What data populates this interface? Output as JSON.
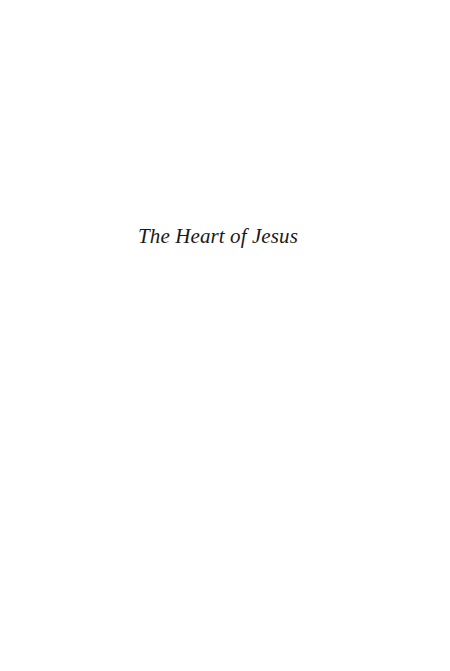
{
  "page": {
    "type": "half-title",
    "title": "The Heart of Jesus",
    "background_color": "#ffffff",
    "text_color": "#1a1a1a"
  }
}
